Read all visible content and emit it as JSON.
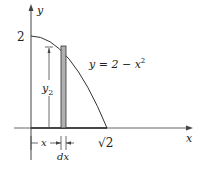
{
  "diagram": {
    "axes": {
      "x_label": "x",
      "y_label": "y"
    },
    "y_intercept_label": "2",
    "x_intercept_label": "√2",
    "curve_label": "y = 2 − x²",
    "curve_label_parts": {
      "lhs": "y = 2 − x",
      "exp": "2"
    },
    "strip_height_label": {
      "base": "y",
      "sub": "2"
    },
    "x_distance_label": "x",
    "strip_width_label": "dx",
    "colors": {
      "line": "#222222",
      "strip": "#b0b0b0",
      "axis": "#555555"
    }
  }
}
